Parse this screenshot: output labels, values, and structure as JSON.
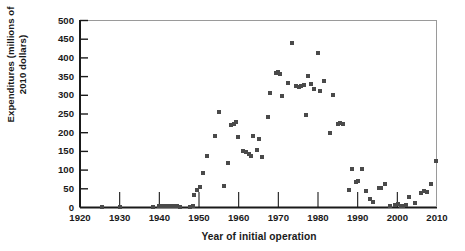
{
  "chart_data": {
    "type": "scatter",
    "title": "",
    "xlabel": "Year of initial operation",
    "ylabel": "Expenditures (millions of 2010 dollars)",
    "ylabel_line1": "Expenditures (millions of",
    "ylabel_line2": "2010 dollars)",
    "xlim": [
      1920,
      2010
    ],
    "ylim": [
      0,
      500
    ],
    "xticks": [
      1920,
      1930,
      1940,
      1950,
      1960,
      1970,
      1980,
      1990,
      2000,
      2010
    ],
    "yticks": [
      0,
      50,
      100,
      150,
      200,
      250,
      300,
      350,
      400,
      450,
      500
    ],
    "grid": false,
    "legend": null,
    "marker_color": "#4a4a4a",
    "marker_shape": "square",
    "axis_color": "#1a1a1a",
    "points": [
      [
        1925.5,
        2
      ],
      [
        1930.0,
        2
      ],
      [
        1938.5,
        2
      ],
      [
        1940.0,
        3
      ],
      [
        1940.8,
        5
      ],
      [
        1941.5,
        4
      ],
      [
        1942.3,
        5
      ],
      [
        1943.0,
        4
      ],
      [
        1943.8,
        3
      ],
      [
        1944.5,
        3
      ],
      [
        1945.3,
        2
      ],
      [
        1947.8,
        2
      ],
      [
        1948.5,
        4
      ],
      [
        1948.8,
        33
      ],
      [
        1949.5,
        47
      ],
      [
        1950.2,
        56
      ],
      [
        1951.0,
        93
      ],
      [
        1952.0,
        138
      ],
      [
        1954.0,
        192
      ],
      [
        1955.0,
        256
      ],
      [
        1956.3,
        58
      ],
      [
        1957.2,
        119
      ],
      [
        1958.0,
        221
      ],
      [
        1958.8,
        224
      ],
      [
        1959.3,
        228
      ],
      [
        1959.8,
        189
      ],
      [
        1961.0,
        152
      ],
      [
        1961.8,
        149
      ],
      [
        1962.5,
        143
      ],
      [
        1963.0,
        138
      ],
      [
        1963.5,
        190
      ],
      [
        1964.5,
        155
      ],
      [
        1965.2,
        183
      ],
      [
        1965.8,
        136
      ],
      [
        1967.5,
        243
      ],
      [
        1968.0,
        305
      ],
      [
        1969.3,
        360
      ],
      [
        1969.8,
        363
      ],
      [
        1970.5,
        357
      ],
      [
        1971.0,
        298
      ],
      [
        1972.5,
        334
      ],
      [
        1973.5,
        440
      ],
      [
        1974.5,
        325
      ],
      [
        1975.2,
        321
      ],
      [
        1975.8,
        326
      ],
      [
        1976.5,
        328
      ],
      [
        1977.0,
        248
      ],
      [
        1977.5,
        352
      ],
      [
        1978.2,
        331
      ],
      [
        1979.0,
        318
      ],
      [
        1980.0,
        414
      ],
      [
        1980.5,
        311
      ],
      [
        1981.5,
        337
      ],
      [
        1983.0,
        198
      ],
      [
        1983.8,
        300
      ],
      [
        1985.0,
        222
      ],
      [
        1985.5,
        225
      ],
      [
        1986.2,
        224
      ],
      [
        1987.8,
        46
      ],
      [
        1988.5,
        104
      ],
      [
        1989.5,
        69
      ],
      [
        1990.0,
        72
      ],
      [
        1991.0,
        102
      ],
      [
        1992.0,
        45
      ],
      [
        1993.0,
        22
      ],
      [
        1993.8,
        14
      ],
      [
        1995.5,
        51
      ],
      [
        1996.0,
        52
      ],
      [
        1996.8,
        64
      ],
      [
        1998.2,
        3
      ],
      [
        1999.5,
        6
      ],
      [
        2000.2,
        9
      ],
      [
        2000.8,
        5
      ],
      [
        2001.5,
        4
      ],
      [
        2002.3,
        8
      ],
      [
        2003.0,
        27
      ],
      [
        2004.5,
        13
      ],
      [
        2006.0,
        38
      ],
      [
        2006.8,
        44
      ],
      [
        2007.5,
        41
      ],
      [
        2008.5,
        62
      ],
      [
        2009.8,
        124
      ]
    ]
  }
}
